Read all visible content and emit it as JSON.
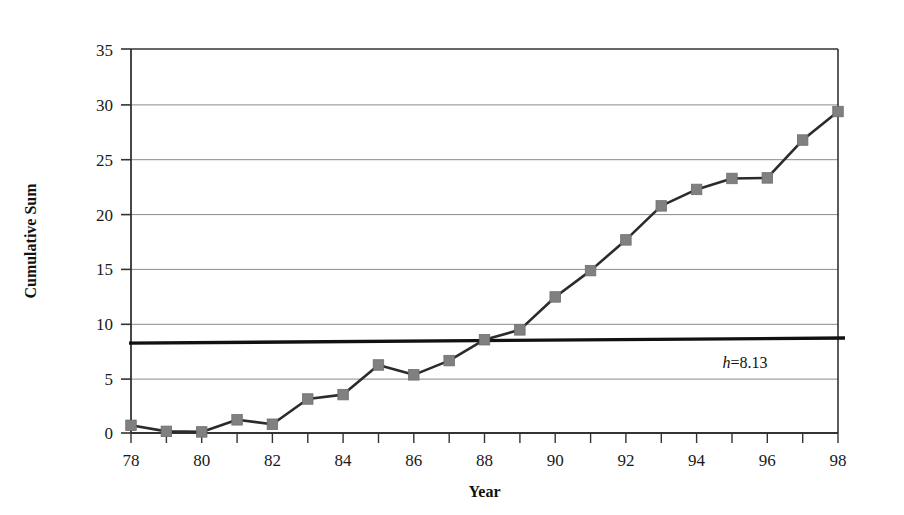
{
  "chart_data": {
    "type": "line",
    "title": "",
    "xlabel": "Year",
    "ylabel": "Cumulative Sum",
    "xlim": [
      78,
      98
    ],
    "ylim": [
      0,
      35
    ],
    "ytick_step": 5,
    "xtick_step": 1,
    "xtick_label_step": 2,
    "grid": "horizontal",
    "legend": "none",
    "marker": "square",
    "marker_color": "#808080",
    "line_color": "#2b2b2b",
    "x": [
      78,
      79,
      80,
      81,
      82,
      83,
      84,
      85,
      86,
      87,
      88,
      89,
      90,
      91,
      92,
      93,
      94,
      95,
      96,
      97,
      98
    ],
    "xticks": [
      78,
      79,
      80,
      81,
      82,
      83,
      84,
      85,
      86,
      87,
      88,
      89,
      90,
      91,
      92,
      93,
      94,
      95,
      96,
      97,
      98
    ],
    "xtick_labels": [
      "78",
      "",
      "80",
      "",
      "82",
      "",
      "84",
      "",
      "86",
      "",
      "88",
      "",
      "90",
      "",
      "92",
      "",
      "94",
      "",
      "96",
      "",
      "98"
    ],
    "yticks": [
      0,
      5,
      10,
      15,
      20,
      25,
      30,
      35
    ],
    "ytick_labels": [
      "0",
      "5",
      "10",
      "15",
      "20",
      "25",
      "30",
      "35"
    ],
    "series": [
      {
        "name": "Cumulative Sum",
        "values": [
          0.7,
          0.15,
          0.1,
          1.2,
          0.8,
          3.1,
          3.5,
          6.2,
          5.3,
          6.6,
          8.5,
          9.4,
          12.4,
          14.8,
          17.6,
          20.7,
          22.2,
          23.2,
          23.25,
          26.7,
          29.3
        ]
      }
    ],
    "threshold_line": {
      "label": "h=8.13",
      "label_italic_prefix": "h",
      "label_rest": "=8.13",
      "value": 8.13,
      "value_start": 8.13,
      "value_end": 8.6,
      "x_start": 78,
      "x_end": 98,
      "color": "#111111"
    }
  }
}
